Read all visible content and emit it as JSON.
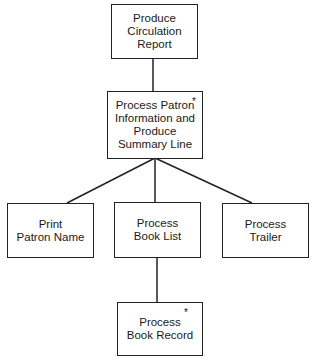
{
  "diagram": {
    "type": "structure-chart",
    "nodes": [
      {
        "id": "root",
        "label": "Produce\nCirculation\nReport",
        "repetition_marker": ""
      },
      {
        "id": "process-patron",
        "label": "Process Patron\nInformation and\nProduce\nSummary Line",
        "repetition_marker": "*"
      },
      {
        "id": "print-patron-name",
        "label": "Print\nPatron Name",
        "repetition_marker": ""
      },
      {
        "id": "process-book-list",
        "label": "Process\nBook List",
        "repetition_marker": ""
      },
      {
        "id": "process-trailer",
        "label": "Process\nTrailer",
        "repetition_marker": ""
      },
      {
        "id": "process-book-record",
        "label": "Process\nBook Record",
        "repetition_marker": "*"
      }
    ],
    "edges": [
      {
        "from": "root",
        "to": "process-patron"
      },
      {
        "from": "process-patron",
        "to": "print-patron-name"
      },
      {
        "from": "process-patron",
        "to": "process-book-list"
      },
      {
        "from": "process-patron",
        "to": "process-trailer"
      },
      {
        "from": "process-book-list",
        "to": "process-book-record"
      }
    ]
  }
}
